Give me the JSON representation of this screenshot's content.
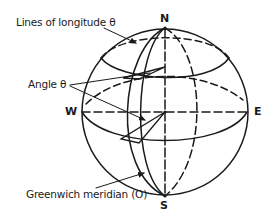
{
  "diagram": {
    "type": "globe-coordinate-diagram",
    "colors": {
      "line": "#1a1a1a",
      "background": "#ffffff"
    },
    "poles": {
      "north": "N",
      "south": "S"
    },
    "directions": {
      "west": "W",
      "east": "E"
    },
    "callouts": {
      "longitude_lines": "Lines of longitude θ",
      "angle": "Angle θ",
      "greenwich": "Greenwich meridian (O)"
    }
  }
}
